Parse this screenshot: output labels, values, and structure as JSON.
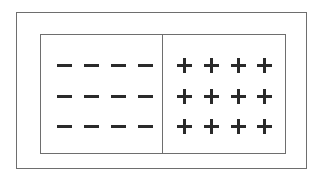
{
  "diagram": {
    "colors": {
      "stroke": "#6e6e6e",
      "sign": "#2a2a2a",
      "background": "#ffffff"
    },
    "left_region": {
      "symbol": "minus",
      "rows": 3,
      "cols": 4
    },
    "right_region": {
      "symbol": "plus",
      "rows": 3,
      "cols": 4
    }
  }
}
